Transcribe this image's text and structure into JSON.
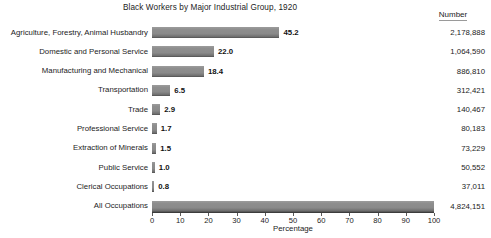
{
  "chart_data": {
    "type": "bar",
    "orientation": "horizontal",
    "title": "Black Workers by Major Industrial Group, 1920",
    "xlabel": "Percentage",
    "ylabel": "",
    "xlim": [
      0,
      100
    ],
    "xticks": [
      0,
      10,
      20,
      30,
      40,
      50,
      60,
      70,
      80,
      90,
      100
    ],
    "grid": false,
    "legend": null,
    "value_column_header": "Number",
    "categories": [
      "Agriculture, Forestry, Animal Husbandry",
      "Domestic and Personal Service",
      "Manufacturing and Mechanical",
      "Transportation",
      "Trade",
      "Professional Service",
      "Extraction of Minerals",
      "Public Service",
      "Clerical Occupations",
      "All Occupations"
    ],
    "values": [
      45.2,
      22.0,
      18.4,
      6.5,
      2.9,
      1.7,
      1.5,
      1.0,
      0.8,
      100.0
    ],
    "value_labels": [
      "45.2",
      "22.0",
      "18.4",
      "6.5",
      "2.9",
      "1.7",
      "1.5",
      "1.0",
      "0.8",
      ""
    ],
    "counts": [
      "2,178,888",
      "1,064,590",
      "886,810",
      "312,421",
      "140,467",
      "80,183",
      "73,229",
      "50,552",
      "37,011",
      "4,824,151"
    ],
    "bar_color": "#8a8a8a",
    "axis_color": "#3c3c3c",
    "text_color": "#1c1c1c",
    "background": "#ffffff"
  },
  "rows": [
    {
      "label": "Agriculture, Forestry, Animal Husbandry",
      "value": 45.2,
      "value_label": "45.2",
      "count": "2,178,888"
    },
    {
      "label": "Domestic and Personal Service",
      "value": 22.0,
      "value_label": "22.0",
      "count": "1,064,590"
    },
    {
      "label": "Manufacturing and Mechanical",
      "value": 18.4,
      "value_label": "18.4",
      "count": "886,810"
    },
    {
      "label": "Transportation",
      "value": 6.5,
      "value_label": "6.5",
      "count": "312,421"
    },
    {
      "label": "Trade",
      "value": 2.9,
      "value_label": "2.9",
      "count": "140,467"
    },
    {
      "label": "Professional Service",
      "value": 1.7,
      "value_label": "1.7",
      "count": "80,183"
    },
    {
      "label": "Extraction of Minerals",
      "value": 1.5,
      "value_label": "1.5",
      "count": "73,229"
    },
    {
      "label": "Public Service",
      "value": 1.0,
      "value_label": "1.0",
      "count": "50,552"
    },
    {
      "label": "Clerical Occupations",
      "value": 0.8,
      "value_label": "0.8",
      "count": "37,011"
    },
    {
      "label": "All Occupations",
      "value": 100.0,
      "value_label": "",
      "count": "4,824,151"
    }
  ],
  "header": {
    "title": "Black Workers by Major Industrial Group, 1920",
    "number_column": "Number"
  },
  "axis": {
    "title": "Percentage",
    "ticks": [
      "0",
      "10",
      "20",
      "30",
      "40",
      "50",
      "60",
      "70",
      "80",
      "90",
      "100"
    ]
  }
}
